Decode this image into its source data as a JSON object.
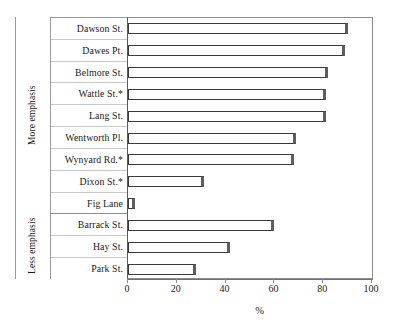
{
  "chart_data": {
    "type": "bar",
    "orientation": "horizontal",
    "title": "",
    "xlabel": "%",
    "ylabel": "",
    "xlim": [
      0,
      100
    ],
    "xticks": [
      0,
      20,
      40,
      60,
      80,
      100
    ],
    "xtick_labels": [
      "0",
      "20",
      "40",
      "60",
      "80",
      "100"
    ],
    "grid": false,
    "legend": "none",
    "categories": [
      "Dawson St.",
      "Dawes Pt.",
      "Belmore St.",
      "Wattle St.*",
      "Lang St.",
      "Wentworth Pl.",
      "Wynyard Rd.*",
      "Dixon St.*",
      "Fig Lane",
      "Barrack St.",
      "Hay St.",
      "Park St."
    ],
    "values": [
      90,
      89,
      82,
      81,
      81,
      69,
      68,
      31,
      3,
      60,
      42,
      28
    ],
    "groups": [
      {
        "label": "More emphasis",
        "categories": [
          "Dawson St.",
          "Dawes Pt.",
          "Belmore St.",
          "Wattle St.*",
          "Lang St.",
          "Wentworth Pl.",
          "Wynyard Rd.*",
          "Dixon St.*",
          "Fig Lane"
        ]
      },
      {
        "label": "Less emphasis",
        "categories": [
          "Barrack St.",
          "Hay St.",
          "Park St."
        ]
      }
    ],
    "colors": {
      "bar_fill": "#ffffff",
      "bar_border": "#3a3a3a",
      "bar_shadow": "#5e5e5e",
      "axis": "#8d8d8d",
      "text": "#1a1a1a"
    }
  },
  "axis": {
    "x_title": "%"
  },
  "groups": {
    "more": "More emphasis",
    "less": "Less emphasis"
  }
}
